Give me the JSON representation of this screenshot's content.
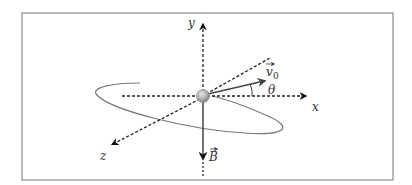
{
  "figure": {
    "labels": {
      "y_axis": "y",
      "x_axis": "x",
      "z_axis": "z",
      "velocity": "v",
      "velocity_subscript": "0",
      "angle": "θ",
      "field": "B"
    },
    "colors": {
      "frame": "#8a8a8a",
      "axes": "#222222",
      "vectors": "#444444",
      "path": "#777777",
      "particle": "#a8a8a8"
    }
  }
}
